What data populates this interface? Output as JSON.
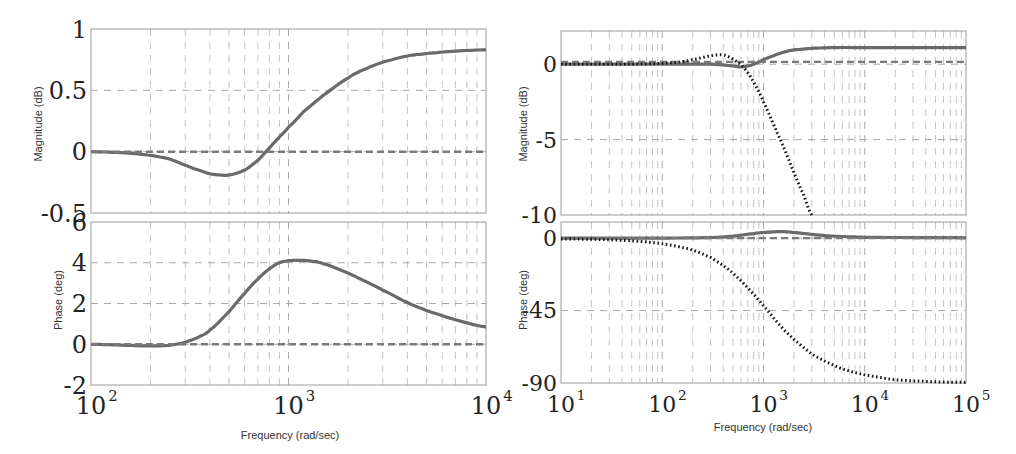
{
  "chart_data": [
    {
      "type": "line",
      "title": "",
      "subplot": "left-magnitude",
      "xscale": "log",
      "xlim": [
        100,
        10000
      ],
      "ylim": [
        -0.5,
        1
      ],
      "xlabel": "",
      "ylabel": "Magnitude (dB)",
      "yticks": [
        1,
        0.5,
        0,
        -0.5
      ],
      "yticklabels": [
        "1",
        "0.5",
        "0",
        "-0.5"
      ],
      "grid": true,
      "series": [
        {
          "name": "solid",
          "style": "solid",
          "x": [
            100,
            150,
            200,
            250,
            300,
            350,
            400,
            450,
            500,
            600,
            700,
            800,
            900,
            1000,
            1200,
            1500,
            2000,
            2500,
            3000,
            4000,
            5000,
            7000,
            10000
          ],
          "y": [
            0,
            -0.01,
            -0.03,
            -0.06,
            -0.11,
            -0.15,
            -0.18,
            -0.19,
            -0.19,
            -0.15,
            -0.07,
            0.03,
            0.12,
            0.2,
            0.33,
            0.46,
            0.6,
            0.68,
            0.73,
            0.78,
            0.8,
            0.82,
            0.83
          ]
        },
        {
          "name": "dashed",
          "style": "dashed",
          "x": [
            100,
            10000
          ],
          "y": [
            0,
            0
          ]
        }
      ]
    },
    {
      "type": "line",
      "subplot": "left-phase",
      "xscale": "log",
      "xlim": [
        100,
        10000
      ],
      "ylim": [
        -2,
        6
      ],
      "xlabel": "Frequency  (rad/sec)",
      "ylabel": "Phase (deg)",
      "xticks": [
        100,
        1000,
        10000
      ],
      "xticklabels": [
        "10^2",
        "10^3",
        "10^4"
      ],
      "yticks": [
        6,
        4,
        2,
        0,
        -2
      ],
      "yticklabels": [
        "6",
        "4",
        "2",
        "0",
        "-2"
      ],
      "grid": true,
      "series": [
        {
          "name": "solid",
          "style": "solid",
          "x": [
            100,
            150,
            200,
            250,
            300,
            350,
            400,
            500,
            600,
            700,
            800,
            900,
            1000,
            1150,
            1300,
            1500,
            2000,
            2500,
            3000,
            4000,
            5000,
            7000,
            10000
          ],
          "y": [
            0,
            -0.05,
            -0.08,
            -0.05,
            0.1,
            0.35,
            0.7,
            1.6,
            2.5,
            3.2,
            3.7,
            4.0,
            4.1,
            4.12,
            4.08,
            3.95,
            3.5,
            3.05,
            2.65,
            2.05,
            1.65,
            1.2,
            0.85
          ]
        },
        {
          "name": "dashed",
          "style": "dashed",
          "x": [
            100,
            10000
          ],
          "y": [
            0,
            0
          ]
        }
      ]
    },
    {
      "type": "line",
      "subplot": "right-magnitude",
      "xscale": "log",
      "xlim": [
        10,
        100000
      ],
      "ylim": [
        -10,
        2.2
      ],
      "xlabel": "",
      "ylabel": "Magnitude (dB)",
      "yticks": [
        0,
        -5,
        -10
      ],
      "yticklabels": [
        "0",
        "-5",
        "-10"
      ],
      "grid": true,
      "series": [
        {
          "name": "solid",
          "style": "solid",
          "x": [
            10,
            100,
            200,
            300,
            400,
            500,
            600,
            700,
            800,
            1000,
            1300,
            1700,
            2000,
            3000,
            5000,
            10000,
            100000
          ],
          "y": [
            0,
            0,
            0,
            0,
            -0.05,
            -0.12,
            -0.18,
            -0.12,
            0,
            0.3,
            0.6,
            0.85,
            0.95,
            1.05,
            1.1,
            1.1,
            1.1
          ]
        },
        {
          "name": "dashed",
          "style": "dashed",
          "x": [
            10,
            100000
          ],
          "y": [
            0.15,
            0.15
          ]
        },
        {
          "name": "dotted",
          "style": "dotted",
          "x": [
            10,
            50,
            100,
            150,
            200,
            300,
            380,
            450,
            550,
            650,
            800,
            1000,
            1300,
            1600,
            2000,
            2500,
            3000
          ],
          "y": [
            0,
            0,
            0.05,
            0.15,
            0.3,
            0.55,
            0.62,
            0.5,
            0.15,
            -0.3,
            -1.2,
            -2.5,
            -4.2,
            -5.6,
            -7.2,
            -8.7,
            -10
          ]
        }
      ]
    },
    {
      "type": "line",
      "subplot": "right-phase",
      "xscale": "log",
      "xlim": [
        10,
        100000
      ],
      "ylim": [
        -90,
        10
      ],
      "xlabel": "Frequency  (rad/sec)",
      "ylabel": "Phase (deg)",
      "xticks": [
        10,
        100,
        1000,
        10000,
        100000
      ],
      "xticklabels": [
        "10^1",
        "10^2",
        "10^3",
        "10^4",
        "10^5"
      ],
      "yticks": [
        0,
        -45,
        -90
      ],
      "yticklabels": [
        "0",
        "-45",
        "-90"
      ],
      "grid": true,
      "series": [
        {
          "name": "solid",
          "style": "solid",
          "x": [
            10,
            100,
            300,
            500,
            800,
            1000,
            1500,
            2000,
            3000,
            5000,
            10000,
            100000
          ],
          "y": [
            0,
            0,
            0.3,
            1.2,
            2.8,
            3.5,
            4.0,
            3.5,
            2.3,
            1.2,
            0.5,
            0.2
          ]
        },
        {
          "name": "dashed",
          "style": "dashed",
          "x": [
            10,
            100000
          ],
          "y": [
            0,
            0
          ]
        },
        {
          "name": "dotted",
          "style": "dotted",
          "x": [
            10,
            30,
            60,
            100,
            150,
            200,
            300,
            400,
            500,
            700,
            1000,
            1500,
            2000,
            3000,
            5000,
            7000,
            10000,
            20000,
            50000,
            100000
          ],
          "y": [
            -0.5,
            -1,
            -2,
            -3.5,
            -5.5,
            -7.5,
            -12,
            -17,
            -22,
            -31,
            -42,
            -55,
            -63,
            -72,
            -79,
            -82.5,
            -85,
            -88,
            -89.2,
            -89.6
          ]
        }
      ]
    }
  ],
  "labels": {
    "left_mag_ylabel": "Magnitude (dB)",
    "left_phase_ylabel": "Phase (deg)",
    "right_mag_ylabel": "Magnitude (dB)",
    "right_phase_ylabel": "Phase (deg)",
    "left_xlabel": "Frequency  (rad/sec)",
    "right_xlabel": "Frequency  (rad/sec)"
  }
}
